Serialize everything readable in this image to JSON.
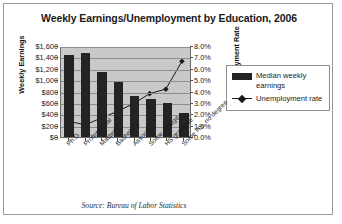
{
  "chart_data": {
    "type": "bar",
    "title": "Weekly Earnings/Unemployment by Education, 2006",
    "source": "Source: Bureau of Labor Statistics",
    "xlabel": "",
    "ylabel": "Weekly Earnings",
    "y2label": "Unemployment Rate",
    "ylim": [
      0,
      1600
    ],
    "y2lim": [
      0,
      8
    ],
    "grid": true,
    "legend_position": "right",
    "categories": [
      "Ph.D.",
      "Professional",
      "Master's",
      "Bachelor's",
      "Associate",
      "Some college",
      "HS graduate",
      "Some HS, no degree"
    ],
    "yticks": [
      "$0",
      "$200",
      "$400",
      "$600",
      "$800",
      "$1,000",
      "$1,200",
      "$1,400",
      "$1,600"
    ],
    "y2ticks": [
      "0.0%",
      "1.0%",
      "2.0%",
      "3.0%",
      "4.0%",
      "5.0%",
      "6.0%",
      "7.0%",
      "8.0%"
    ],
    "series": [
      {
        "name": "Median weekly earnings",
        "type": "bar",
        "axis": "left",
        "color": "#232323",
        "values": [
          1441,
          1474,
          1140,
          962,
          721,
          674,
          595,
          419
        ]
      },
      {
        "name": "Unemployment rate",
        "type": "line",
        "axis": "right",
        "color": "#1a1a1a",
        "values": [
          1.4,
          1.1,
          1.7,
          2.3,
          3.0,
          3.9,
          4.3,
          6.8
        ]
      }
    ]
  },
  "legend": {
    "entries": [
      "Median weekly earnings",
      "Unemployment rate"
    ]
  }
}
